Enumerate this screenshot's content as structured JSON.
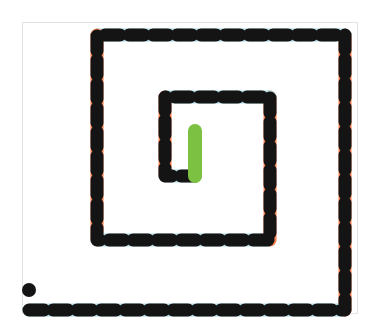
{
  "figure": {
    "title": "",
    "type": "path-diagram",
    "canvas": {
      "width": 380,
      "height": 336,
      "background": "#ffffff"
    },
    "panel": {
      "x": 22,
      "y": 22,
      "width": 336,
      "height": 292,
      "border_color": "#e3e3e3",
      "fill": "#ffffff"
    }
  },
  "colors": {
    "dash_dark": "#141414",
    "horizontal_gap": "#a9d8e2",
    "vertical_gap": "#fb7e4f",
    "end_marker": "#7cc141",
    "start_marker": "#141414",
    "panel_border": "#e3e3e3",
    "background": "#ffffff"
  },
  "style": {
    "stroke_width": 13,
    "dash_length": 15,
    "gap_length": 9,
    "line_cap": "butt"
  },
  "markers": {
    "start": {
      "name": "start-dot",
      "shape": "circle",
      "x": 29,
      "y": 290,
      "radius": 7,
      "color": "#141414"
    },
    "end": {
      "name": "end-segment",
      "shape": "capsule",
      "x": 195,
      "y_top": 131,
      "y_bottom": 176,
      "thickness": 14,
      "color": "#7cc141"
    }
  },
  "path": {
    "name": "inward-rectangular-spiral",
    "turns": 2.75,
    "direction": "clockwise-inward",
    "start_point": {
      "x": 29,
      "y": 310
    },
    "end_point": {
      "x": 195,
      "y": 131
    },
    "vertices": [
      {
        "x": 29,
        "y": 310,
        "label": "start (bottom-left outer)"
      },
      {
        "x": 345,
        "y": 310,
        "label": "bottom-right outer corner"
      },
      {
        "x": 345,
        "y": 35,
        "label": "top-right outer corner"
      },
      {
        "x": 97,
        "y": 35,
        "label": "top-left outer corner"
      },
      {
        "x": 97,
        "y": 240,
        "label": "bottom-left loop-2 corner"
      },
      {
        "x": 270,
        "y": 240,
        "label": "bottom-right loop-2 corner"
      },
      {
        "x": 270,
        "y": 97,
        "label": "top-right loop-2 corner"
      },
      {
        "x": 165,
        "y": 97,
        "label": "top-left inner corner"
      },
      {
        "x": 165,
        "y": 176,
        "label": "bottom-left inner corner"
      },
      {
        "x": 195,
        "y": 176,
        "label": "inner turn to end"
      },
      {
        "x": 195,
        "y": 131,
        "label": "end (green segment top)"
      }
    ],
    "segments": [
      {
        "id": 0,
        "orientation": "horizontal",
        "from": {
          "x": 29,
          "y": 310
        },
        "to": {
          "x": 345,
          "y": 310
        },
        "gap_color": "#a9d8e2"
      },
      {
        "id": 1,
        "orientation": "vertical",
        "from": {
          "x": 345,
          "y": 310
        },
        "to": {
          "x": 345,
          "y": 35
        },
        "gap_color": "#fb7e4f"
      },
      {
        "id": 2,
        "orientation": "horizontal",
        "from": {
          "x": 345,
          "y": 35
        },
        "to": {
          "x": 97,
          "y": 35
        },
        "gap_color": "#a9d8e2"
      },
      {
        "id": 3,
        "orientation": "vertical",
        "from": {
          "x": 97,
          "y": 35
        },
        "to": {
          "x": 97,
          "y": 240
        },
        "gap_color": "#fb7e4f"
      },
      {
        "id": 4,
        "orientation": "horizontal",
        "from": {
          "x": 97,
          "y": 240
        },
        "to": {
          "x": 270,
          "y": 240
        },
        "gap_color": "#a9d8e2"
      },
      {
        "id": 5,
        "orientation": "vertical",
        "from": {
          "x": 270,
          "y": 240
        },
        "to": {
          "x": 270,
          "y": 97
        },
        "gap_color": "#fb7e4f"
      },
      {
        "id": 6,
        "orientation": "horizontal",
        "from": {
          "x": 270,
          "y": 97
        },
        "to": {
          "x": 165,
          "y": 97
        },
        "gap_color": "#a9d8e2"
      },
      {
        "id": 7,
        "orientation": "vertical",
        "from": {
          "x": 165,
          "y": 97
        },
        "to": {
          "x": 165,
          "y": 176
        },
        "gap_color": "#fb7e4f"
      },
      {
        "id": 8,
        "orientation": "horizontal",
        "from": {
          "x": 165,
          "y": 176
        },
        "to": {
          "x": 195,
          "y": 176
        },
        "gap_color": "#a9d8e2"
      },
      {
        "id": 9,
        "orientation": "vertical",
        "from": {
          "x": 195,
          "y": 176
        },
        "to": {
          "x": 195,
          "y": 131
        },
        "gap_color": "#7cc141",
        "solid": true
      }
    ]
  },
  "labels": {
    "none_visible": ""
  }
}
